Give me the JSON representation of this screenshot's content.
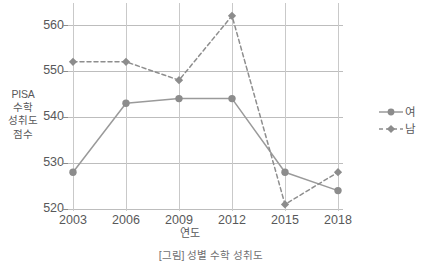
{
  "chart_data": {
    "type": "line",
    "title": "",
    "xlabel": "연도",
    "ylabel": "PISA 수학 성취도 점수",
    "ylabel_lines": [
      "PISA",
      "수학",
      "성취도",
      "점수"
    ],
    "categories": [
      "2003",
      "2006",
      "2009",
      "2012",
      "2015",
      "2018"
    ],
    "x": [
      2003,
      2006,
      2009,
      2012,
      2015,
      2018
    ],
    "ylim": [
      520,
      562
    ],
    "yticks": [
      520,
      530,
      540,
      550,
      560
    ],
    "ytick_labels": [
      "520",
      "530",
      "540",
      "550",
      "560"
    ],
    "grid": "both",
    "legend_position": "right",
    "series": [
      {
        "name": "여",
        "marker": "circle",
        "linestyle": "solid",
        "color": "#9a9a9a",
        "values": [
          528,
          543,
          544,
          544,
          528,
          524
        ]
      },
      {
        "name": "남",
        "marker": "diamond",
        "linestyle": "dashed",
        "color": "#8e8e8e",
        "values": [
          552,
          552,
          548,
          562,
          521,
          528
        ]
      }
    ]
  },
  "legend": {
    "items": [
      {
        "label": "여",
        "marker": "circle-marker",
        "style": "solid"
      },
      {
        "label": "남",
        "marker": "diamond-marker",
        "style": "dashed"
      }
    ]
  },
  "axes": {
    "x_label": "연도",
    "y_label_lines": [
      "PISA",
      "수학",
      "성취도",
      "점수"
    ],
    "x_tick_labels": [
      "2003",
      "2006",
      "2009",
      "2012",
      "2015",
      "2018"
    ],
    "y_tick_labels": [
      "520",
      "530",
      "540",
      "550",
      "560"
    ]
  },
  "caption": {
    "text": "[그림] 성별 수학 성취도"
  },
  "colors": {
    "line": "#9a9a9a",
    "marker": "#8c8c8c",
    "grid": "#c3c3c3",
    "text": "#58585a"
  }
}
